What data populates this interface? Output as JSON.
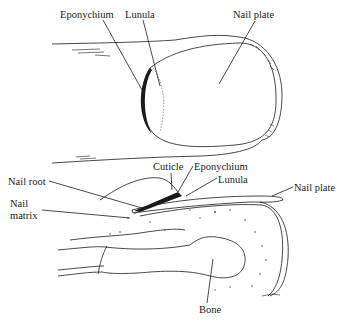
{
  "figure": {
    "top_view": {
      "labels": {
        "eponychium": "Eponychium",
        "lunula": "Lunula",
        "nail_plate": "Nail plate"
      }
    },
    "section_view": {
      "labels": {
        "cuticle": "Cuticle",
        "eponychium": "Eponychium",
        "lunula": "Lunula",
        "nail_plate": "Nail plate",
        "nail_root": "Nail root",
        "nail_matrix_line1": "Nail",
        "nail_matrix_line2": "matrix",
        "bone": "Bone"
      }
    },
    "colors": {
      "ink": "#1a1a1a",
      "stipple": "#9a9a9a",
      "background": "#ffffff"
    }
  }
}
